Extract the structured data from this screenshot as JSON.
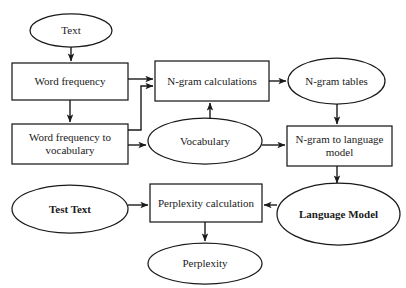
{
  "diagram": {
    "top_caption": "",
    "colors": {
      "stroke": "#1a1a1a",
      "background": "#ffffff",
      "text": "#1a1a1a",
      "caption": "#b9b9bd"
    },
    "nodes": [
      {
        "id": "text",
        "label": "Text",
        "shape": "ellipse",
        "bold": false,
        "x": 30,
        "y": 14,
        "w": 82,
        "h": 33
      },
      {
        "id": "word-frequency",
        "label": "Word frequency",
        "shape": "rectangle",
        "bold": false,
        "x": 12,
        "y": 63,
        "w": 116,
        "h": 37
      },
      {
        "id": "wf-to-vocab",
        "label": "Word frequency to vocabulary",
        "shape": "rectangle",
        "bold": false,
        "x": 12,
        "y": 124,
        "w": 116,
        "h": 40
      },
      {
        "id": "ngram-calc",
        "label": "N-gram calculations",
        "shape": "rectangle",
        "bold": false,
        "x": 155,
        "y": 61,
        "w": 114,
        "h": 40
      },
      {
        "id": "ngram-tables",
        "label": "N-gram tables",
        "shape": "ellipse",
        "bold": false,
        "x": 288,
        "y": 58,
        "w": 97,
        "h": 46
      },
      {
        "id": "vocabulary",
        "label": "Vocabulary",
        "shape": "ellipse",
        "bold": false,
        "x": 148,
        "y": 118,
        "w": 114,
        "h": 46
      },
      {
        "id": "ngram-to-lm",
        "label": "N-gram to language model",
        "shape": "rectangle",
        "bold": false,
        "x": 287,
        "y": 126,
        "w": 105,
        "h": 40
      },
      {
        "id": "test-text",
        "label": "Test Text",
        "shape": "ellipse",
        "bold": true,
        "x": 12,
        "y": 185,
        "w": 116,
        "h": 48
      },
      {
        "id": "perplexity-calc",
        "label": "Perplexity calculation",
        "shape": "rectangle",
        "bold": false,
        "x": 150,
        "y": 184,
        "w": 112,
        "h": 38
      },
      {
        "id": "language-model",
        "label": "Language Model",
        "shape": "ellipse",
        "bold": true,
        "x": 277,
        "y": 183,
        "w": 123,
        "h": 62
      },
      {
        "id": "perplexity",
        "label": "Perplexity",
        "shape": "ellipse",
        "bold": false,
        "x": 148,
        "y": 243,
        "w": 114,
        "h": 41
      }
    ],
    "edges": [
      {
        "id": "text-to-word-frequency",
        "from": "text",
        "to": "word-frequency"
      },
      {
        "id": "word-frequency-to-wf-to-vocab",
        "from": "word-frequency",
        "to": "wf-to-vocab"
      },
      {
        "id": "word-frequency-to-ngram-calc",
        "from": "word-frequency",
        "to": "ngram-calc"
      },
      {
        "id": "wf-to-vocab-to-ngram-calc",
        "from": "wf-to-vocab",
        "to": "ngram-calc"
      },
      {
        "id": "wf-to-vocab-to-vocabulary",
        "from": "wf-to-vocab",
        "to": "vocabulary"
      },
      {
        "id": "ngram-calc-to-ngram-tables",
        "from": "ngram-calc",
        "to": "ngram-tables"
      },
      {
        "id": "vocabulary-to-ngram-calc",
        "from": "vocabulary",
        "to": "ngram-calc"
      },
      {
        "id": "vocabulary-to-ngram-to-lm",
        "from": "vocabulary",
        "to": "ngram-to-lm"
      },
      {
        "id": "ngram-tables-to-ngram-to-lm",
        "from": "ngram-tables",
        "to": "ngram-to-lm"
      },
      {
        "id": "ngram-to-lm-to-language-model",
        "from": "ngram-to-lm",
        "to": "language-model"
      },
      {
        "id": "test-text-to-perplexity-calc",
        "from": "test-text",
        "to": "perplexity-calc"
      },
      {
        "id": "language-model-to-perplexity-calc",
        "from": "language-model",
        "to": "perplexity-calc"
      },
      {
        "id": "perplexity-calc-to-perplexity",
        "from": "perplexity-calc",
        "to": "perplexity"
      }
    ]
  }
}
